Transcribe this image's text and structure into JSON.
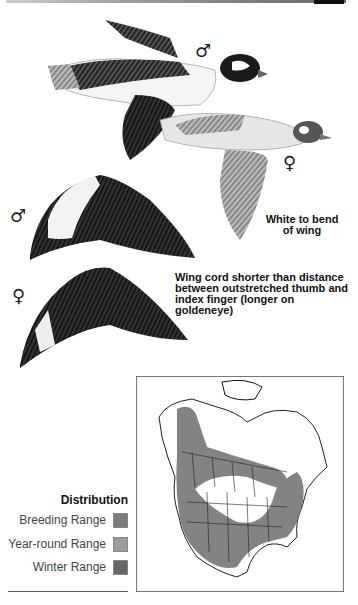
{
  "illustration": {
    "subjects": [
      {
        "name": "male-bird-in-flight",
        "symbol": "♂"
      },
      {
        "name": "female-bird-in-flight",
        "symbol": "♀"
      },
      {
        "name": "male-wing",
        "symbol": "♂"
      },
      {
        "name": "female-wing",
        "symbol": "♀"
      }
    ],
    "notes": {
      "male_wing_line1": "White to bend",
      "male_wing_line2": "of wing",
      "female_wing_line1": "Wing cord shorter than distance",
      "female_wing_line2": "between outstretched thumb and",
      "female_wing_line3": "index finger (longer on goldeneye)"
    }
  },
  "legend": {
    "title": "Distribution",
    "items": [
      {
        "label": "Breeding Range",
        "color": "#7b7b7b"
      },
      {
        "label": "Year-round Range",
        "color": "#9d9d9d"
      },
      {
        "label": "Winter Range",
        "color": "#666666"
      }
    ]
  },
  "map": {
    "region": "North America",
    "range_color": "#757575"
  }
}
